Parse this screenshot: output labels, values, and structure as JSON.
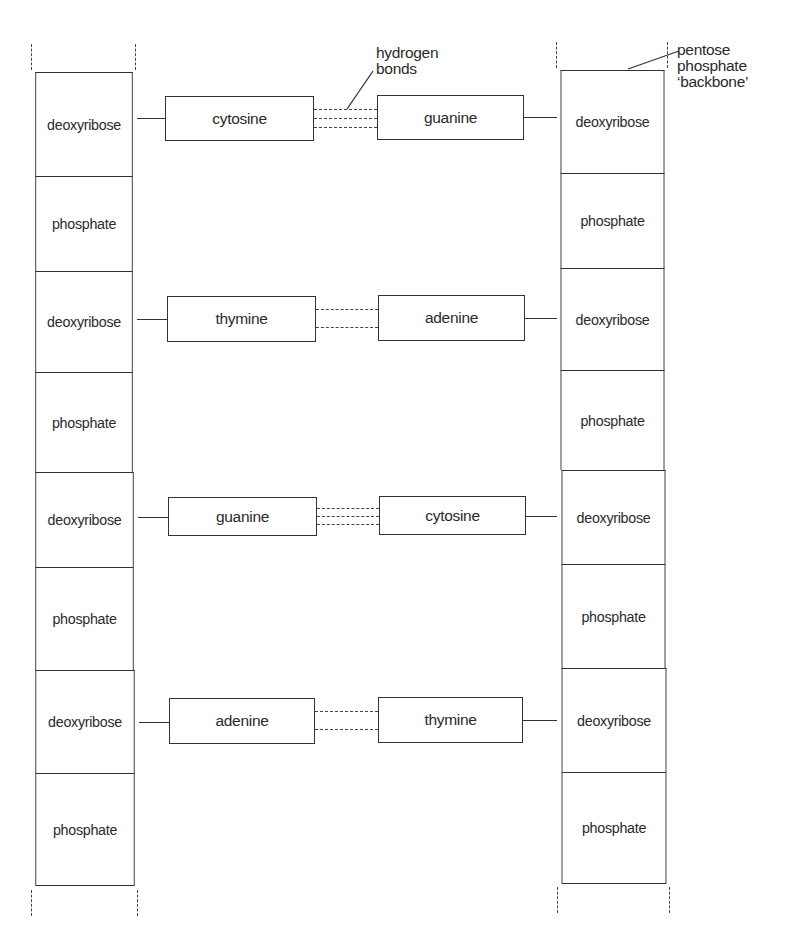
{
  "diagram": {
    "left_strand": {
      "segments": [
        {
          "label": "deoxyribose",
          "top": 72,
          "bottom": 176
        },
        {
          "label": "phosphate",
          "top": 176,
          "bottom": 271
        },
        {
          "label": "deoxyribose",
          "top": 271,
          "bottom": 372
        },
        {
          "label": "phosphate",
          "top": 372,
          "bottom": 472
        },
        {
          "label": "deoxyribose",
          "top": 472,
          "bottom": 567
        },
        {
          "label": "phosphate",
          "top": 567,
          "bottom": 670
        },
        {
          "label": "deoxyribose",
          "top": 670,
          "bottom": 773
        },
        {
          "label": "phosphate",
          "top": 773,
          "bottom": 885
        }
      ]
    },
    "right_strand": {
      "segments": [
        {
          "label": "deoxyribose",
          "top": 70,
          "bottom": 173
        },
        {
          "label": "phosphate",
          "top": 173,
          "bottom": 268
        },
        {
          "label": "deoxyribose",
          "top": 268,
          "bottom": 370
        },
        {
          "label": "phosphate",
          "top": 370,
          "bottom": 470
        },
        {
          "label": "deoxyribose",
          "top": 470,
          "bottom": 564
        },
        {
          "label": "phosphate",
          "top": 564,
          "bottom": 668
        },
        {
          "label": "deoxyribose",
          "top": 668,
          "bottom": 772
        },
        {
          "label": "phosphate",
          "top": 772,
          "bottom": 883
        }
      ]
    },
    "base_pairs": [
      {
        "left": "cytosine",
        "right": "guanine",
        "hydrogen_bonds": 3
      },
      {
        "left": "thymine",
        "right": "adenine",
        "hydrogen_bonds": 2
      },
      {
        "left": "guanine",
        "right": "cytosine",
        "hydrogen_bonds": 3
      },
      {
        "left": "adenine",
        "right": "thymine",
        "hydrogen_bonds": 2
      }
    ],
    "annotations": {
      "hydrogen_bonds": [
        "hydrogen",
        "bonds"
      ],
      "backbone": [
        "pentose",
        "phosphate",
        "‘backbone’"
      ]
    }
  }
}
